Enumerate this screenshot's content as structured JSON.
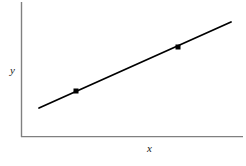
{
  "figure": {
    "title": "",
    "background_color": "#ffffff",
    "width": 246,
    "height": 166
  },
  "axes": {
    "x_label": "x",
    "y_label": "y",
    "axis_color": "#808080",
    "x_axis": {
      "x1": 21,
      "y1": 137,
      "x2": 243,
      "y2": 137
    },
    "y_axis": {
      "x1": 21,
      "y1": 2,
      "x2": 21,
      "y2": 137
    }
  },
  "line": {
    "color": "#000000",
    "width": 1.8,
    "start": {
      "x": 39,
      "y": 108
    },
    "end": {
      "x": 231,
      "y": 22
    }
  },
  "markers": {
    "color": "#000000",
    "size": 5,
    "points": [
      {
        "x": 76,
        "y": 91
      },
      {
        "x": 178,
        "y": 47
      }
    ]
  },
  "chart_data": {
    "type": "line",
    "title": "",
    "xlabel": "x",
    "ylabel": "y",
    "grid": false,
    "legend": "none",
    "axis_ticks": {
      "x": [],
      "y": []
    },
    "series": [
      {
        "name": "trend-line",
        "style": "solid",
        "color": "#000000",
        "x": [
          0.081,
          0.899
        ],
        "y": [
          0.215,
          0.852
        ],
        "note": "Straight increasing line drawn in normalized axes coordinates (0-1 of plotted area), positive slope"
      }
    ],
    "highlighted_points": [
      {
        "label": "point-1",
        "x": 0.239,
        "y": 0.341
      },
      {
        "label": "point-2",
        "x": 0.673,
        "y": 0.667
      }
    ],
    "xlim": [
      0,
      1
    ],
    "ylim": [
      0,
      1
    ]
  }
}
